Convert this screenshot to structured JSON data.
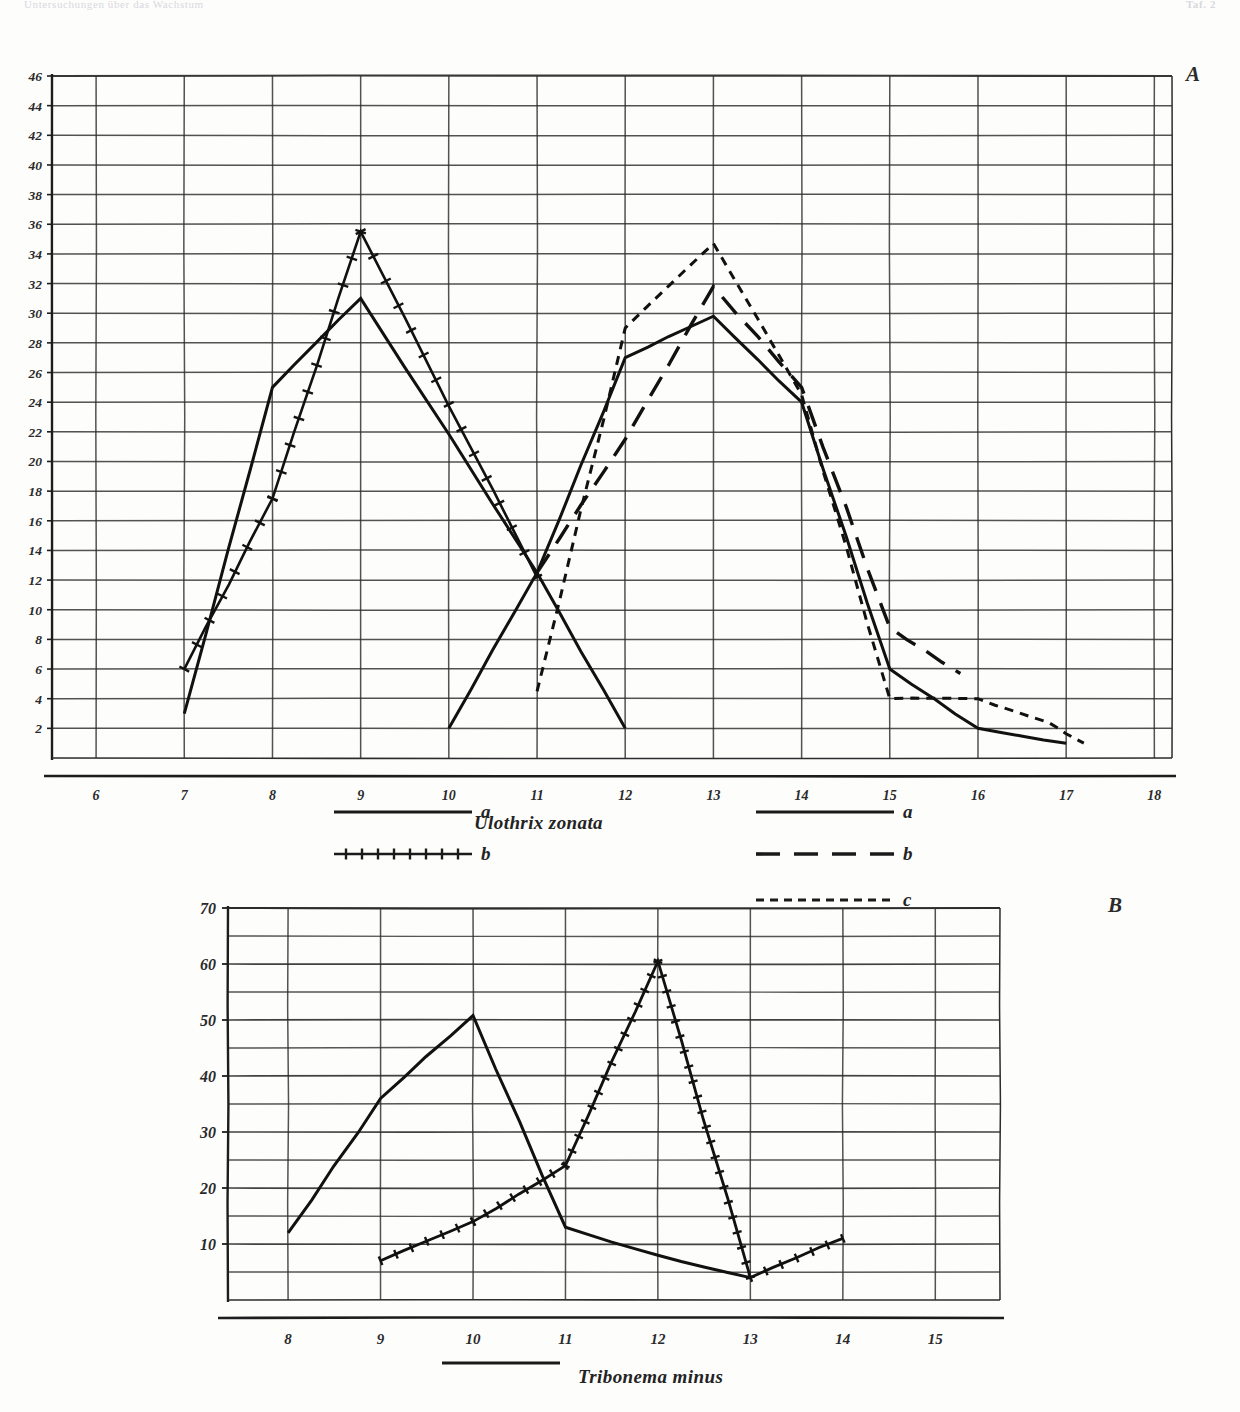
{
  "runhead": {
    "left": "Untersuchungen über das Wachstum",
    "right": "Taf. 2"
  },
  "panels": {
    "a_letter": "A",
    "b_letter": "B"
  },
  "species": {
    "top": "Ulothrix zonata",
    "bottom": "Tribonema minus"
  },
  "legend_a_left": {
    "rows": [
      {
        "label": "a",
        "style": "solid"
      },
      {
        "label": "b",
        "style": "cross-hatched"
      }
    ]
  },
  "legend_a_right": {
    "rows": [
      {
        "label": "a",
        "style": "solid"
      },
      {
        "label": "b",
        "style": "long-dash"
      },
      {
        "label": "c",
        "style": "short-dash"
      }
    ]
  },
  "legend_b": {
    "rows": [
      {
        "label": "Tribonema minus",
        "style": "solid"
      }
    ]
  },
  "chart_data": [
    {
      "id": "panel-a",
      "type": "line",
      "title": "Ulothrix zonata",
      "panel": "A",
      "xlabel": "",
      "ylabel": "",
      "xlim": [
        5.5,
        18.2
      ],
      "ylim": [
        0,
        46
      ],
      "grid": true,
      "xticks": [
        6,
        7,
        8,
        9,
        10,
        11,
        12,
        13,
        14,
        15,
        16,
        17,
        18
      ],
      "yticks": [
        2,
        4,
        6,
        8,
        10,
        12,
        14,
        16,
        18,
        20,
        22,
        24,
        26,
        28,
        30,
        32,
        34,
        36,
        38,
        40,
        42,
        44,
        46
      ],
      "legend_position": "below",
      "series": [
        {
          "name": "a",
          "group": "left",
          "style": "solid",
          "x": [
            7,
            8,
            9,
            11,
            12
          ],
          "values": [
            3,
            25,
            31,
            12.5,
            2
          ]
        },
        {
          "name": "b",
          "group": "left",
          "style": "cross-hatched",
          "x": [
            7,
            8,
            9,
            11
          ],
          "values": [
            6,
            17.5,
            35.5,
            12.2
          ]
        },
        {
          "name": "a",
          "group": "right",
          "style": "solid",
          "x": [
            10,
            11,
            12,
            13,
            14,
            15,
            16,
            17
          ],
          "values": [
            2,
            12.5,
            27,
            29.8,
            24,
            6,
            2,
            1
          ]
        },
        {
          "name": "b",
          "group": "right",
          "style": "long-dash",
          "x": [
            11,
            12,
            13,
            14,
            15,
            15.8
          ],
          "values": [
            12.5,
            21.5,
            31.8,
            25,
            8.8,
            5.7
          ]
        },
        {
          "name": "c",
          "group": "right",
          "style": "short-dash",
          "x": [
            11,
            12,
            13,
            14,
            15,
            16,
            16.8,
            17.2
          ],
          "values": [
            4.5,
            29,
            34.7,
            24.5,
            4,
            4,
            2.4,
            1
          ]
        }
      ]
    },
    {
      "id": "panel-b",
      "type": "line",
      "title": "Tribonema minus",
      "panel": "B",
      "xlabel": "",
      "ylabel": "",
      "xlim": [
        7.35,
        15.7
      ],
      "ylim": [
        0,
        70
      ],
      "grid": true,
      "xticks": [
        8,
        9,
        10,
        11,
        12,
        13,
        14,
        15
      ],
      "yticks": [
        10,
        20,
        30,
        40,
        50,
        60,
        70
      ],
      "yminor": [
        5,
        15,
        25,
        35,
        45,
        55,
        65
      ],
      "legend_position": "below",
      "series": [
        {
          "name": "solid",
          "style": "solid",
          "x": [
            8,
            9,
            10,
            11,
            12,
            13
          ],
          "values": [
            12,
            36,
            50.8,
            13,
            8,
            4
          ]
        },
        {
          "name": "cross-hatched",
          "style": "cross-hatched",
          "x": [
            9,
            10,
            11,
            12,
            13,
            14
          ],
          "values": [
            7,
            14,
            24,
            60.5,
            4,
            11
          ]
        }
      ]
    }
  ]
}
